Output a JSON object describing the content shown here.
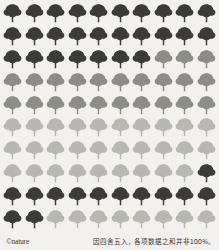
{
  "figure": {
    "type": "pictogram",
    "icon": "tree-icon",
    "rows": 10,
    "columns": 10,
    "total_icons": 100,
    "background_color": "#f3f1ed"
  },
  "footer": {
    "logo_text": "©nature",
    "caption_text": "因四舍五入，各项数据之和并非100%。"
  },
  "chart_data": {
    "type": "pictogram",
    "title": "",
    "unit": "1 tree = 1%",
    "total": 100,
    "colors": {
      "dark": "#3b3b39",
      "medium": "#8d8d88",
      "light": "#b8b8b2",
      "pale": "#c9c9c3"
    },
    "legend": [
      {
        "name": "dark",
        "color": "#3b3b39",
        "count": 40
      },
      {
        "name": "medium",
        "color": "#8d8d88",
        "count": 21
      },
      {
        "name": "light",
        "color": "#b8b8b2",
        "count": 39
      }
    ],
    "cells": [
      [
        "dark",
        "dark",
        "dark",
        "dark",
        "dark",
        "dark",
        "dark",
        "dark",
        "dark",
        "dark"
      ],
      [
        "dark",
        "dark",
        "dark",
        "dark",
        "dark",
        "dark",
        "dark",
        "dark",
        "dark",
        "dark"
      ],
      [
        "dark",
        "dark",
        "dark",
        "dark",
        "dark",
        "dark",
        "dark",
        "medium",
        "medium",
        "medium"
      ],
      [
        "medium",
        "medium",
        "medium",
        "medium",
        "medium",
        "medium",
        "medium",
        "medium",
        "medium",
        "medium"
      ],
      [
        "medium",
        "medium",
        "medium",
        "medium",
        "medium",
        "medium",
        "medium",
        "medium",
        "medium",
        "medium"
      ],
      [
        "light",
        "light",
        "light",
        "light",
        "light",
        "light",
        "light",
        "light",
        "light",
        "light"
      ],
      [
        "light",
        "light",
        "light",
        "light",
        "light",
        "light",
        "light",
        "light",
        "light",
        "light"
      ],
      [
        "light",
        "light",
        "light",
        "light",
        "light",
        "light",
        "light",
        "light",
        "light",
        "dark"
      ],
      [
        "dark",
        "dark",
        "dark",
        "dark",
        "dark",
        "dark",
        "dark",
        "dark",
        "dark",
        "dark"
      ],
      [
        "dark",
        "dark",
        "light",
        "light",
        "light",
        "light",
        "light",
        "light",
        "light",
        "light"
      ]
    ]
  }
}
